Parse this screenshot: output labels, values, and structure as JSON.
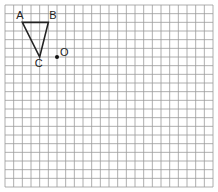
{
  "diagram": {
    "type": "grid-geometry",
    "grid": {
      "columns": 24,
      "rows": 21,
      "origin_px": [
        5,
        5
      ],
      "cell_px": 8.667,
      "line_color": "#9a9a9a",
      "border_color": "#8a8a8a"
    },
    "triangle": {
      "vertices": [
        "A",
        "B",
        "C"
      ],
      "stroke_color": "#222222"
    },
    "points": [
      {
        "label": "A",
        "gx": 2,
        "gy": 2,
        "label_dx": -6,
        "label_dy": -3
      },
      {
        "label": "B",
        "gx": 5,
        "gy": 2,
        "label_dx": 1,
        "label_dy": -3
      },
      {
        "label": "C",
        "gx": 4,
        "gy": 6,
        "label_dx": -5,
        "label_dy": 10
      },
      {
        "label": "O",
        "gx": 6,
        "gy": 6,
        "label_dx": 3,
        "label_dy": -1,
        "dot": true
      }
    ],
    "labels": {
      "A": "A",
      "B": "B",
      "C": "C",
      "O": "O"
    }
  }
}
